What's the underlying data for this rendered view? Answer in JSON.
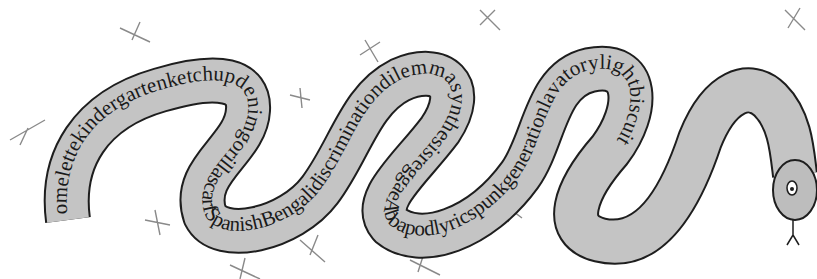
{
  "puzzle": {
    "type": "word-snake",
    "words": [
      "omelette",
      "kindergarten",
      "ketchup",
      "denim",
      "gorilla",
      "scarf",
      "Spanish",
      "Bengali",
      "discrimination",
      "dilemma",
      "synthesis",
      "reggae",
      "Abba",
      "apod",
      "lyrics",
      "punk",
      "generation",
      "lavatory",
      "light",
      "biscuit"
    ],
    "text_along_snake": "omelettekindergartenketchupdenimgorillascarfSpanishBengalidiscriminationdilemmasynthesisreggaeAbbapodlyricspunkgenerationlavatorylightbiscuit"
  },
  "colors": {
    "snake_fill": "#c4c4c4",
    "outline": "#1e1e1e",
    "pencil": "#8a8a8a",
    "background": "#ffffff"
  }
}
